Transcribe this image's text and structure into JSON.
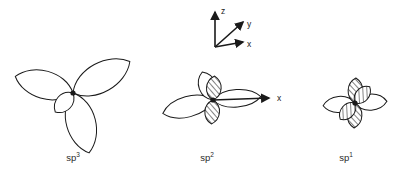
{
  "figure": {
    "background_color": "#ffffff",
    "stroke_color": "#1a1a1a",
    "width": 397,
    "height": 179,
    "title": ""
  },
  "axis_triad": {
    "name": "coordinate-axis-triad",
    "origin": {
      "x": 215,
      "y": 47
    },
    "axes": [
      {
        "id": "z",
        "label": "z",
        "tip": {
          "x": 215,
          "y": 12
        },
        "label_pos": {
          "x": 221,
          "y": 14
        }
      },
      {
        "id": "y",
        "label": "y",
        "tip": {
          "x": 243,
          "y": 22
        },
        "label_pos": {
          "x": 247,
          "y": 27
        }
      },
      {
        "id": "x",
        "label": "x",
        "tip": {
          "x": 243,
          "y": 42
        },
        "label_pos": {
          "x": 247,
          "y": 47
        }
      }
    ]
  },
  "groups": [
    {
      "id": "sp3",
      "name": "sp3-orbital-diagram",
      "caption_text": "sp",
      "caption_superscript": "3",
      "caption_pos": {
        "x": 73,
        "y": 152
      },
      "center": {
        "x": 73,
        "y": 93
      },
      "lobes": [
        {
          "id": "sp3-lobe-upper-left",
          "angle_deg": 196,
          "length": 60,
          "width": 19,
          "style": "outline"
        },
        {
          "id": "sp3-lobe-upper-right",
          "angle_deg": 331,
          "length": 65,
          "width": 20,
          "style": "outline"
        },
        {
          "id": "sp3-lobe-bottom",
          "angle_deg": 75,
          "length": 62,
          "width": 20,
          "style": "outline"
        },
        {
          "id": "sp3-lobe-back-small",
          "angle_deg": 133,
          "length": 26,
          "width": 11,
          "style": "outline"
        }
      ]
    },
    {
      "id": "sp2",
      "name": "sp2-orbital-diagram",
      "caption_text": "sp",
      "caption_superscript": "2",
      "caption_pos": {
        "x": 207,
        "y": 152
      },
      "center": {
        "x": 213,
        "y": 100
      },
      "lobes": [
        {
          "id": "sp2-lobe-left-long",
          "angle_deg": 165,
          "length": 52,
          "width": 14,
          "style": "outline"
        },
        {
          "id": "sp2-lobe-upper-left",
          "angle_deg": 249,
          "length": 30,
          "width": 12,
          "style": "outline"
        },
        {
          "id": "sp2-lobe-right",
          "angle_deg": 356,
          "length": 48,
          "width": 12,
          "style": "outline"
        },
        {
          "id": "sp2-p-orbital-up",
          "angle_deg": 274,
          "length": 24,
          "width": 10,
          "style": "hatched"
        },
        {
          "id": "sp2-p-orbital-down",
          "angle_deg": 94,
          "length": 24,
          "width": 10,
          "style": "hatched"
        }
      ],
      "axis_arrow": {
        "id": "sp2-x-axis",
        "label": "x",
        "from": {
          "x": 213,
          "y": 100
        },
        "to": {
          "x": 269,
          "y": 98
        },
        "label_pos": {
          "x": 277,
          "y": 101
        }
      }
    },
    {
      "id": "sp1",
      "name": "sp1-orbital-diagram",
      "caption_text": "sp",
      "caption_superscript": "1",
      "caption_pos": {
        "x": 346,
        "y": 152
      },
      "center": {
        "x": 355,
        "y": 103
      },
      "lobes": [
        {
          "id": "sp1-lobe-left",
          "angle_deg": 175,
          "length": 32,
          "width": 11,
          "style": "outline"
        },
        {
          "id": "sp1-lobe-right",
          "angle_deg": 357,
          "length": 32,
          "width": 11,
          "style": "outline"
        },
        {
          "id": "sp1-p-orbital-up",
          "angle_deg": 272,
          "length": 25,
          "width": 10,
          "style": "hatched"
        },
        {
          "id": "sp1-p-orbital-down",
          "angle_deg": 92,
          "length": 25,
          "width": 10,
          "style": "hatched"
        },
        {
          "id": "sp1-p-orbital-diag-up",
          "angle_deg": 312,
          "length": 22,
          "width": 9,
          "style": "hatched"
        },
        {
          "id": "sp1-p-orbital-diag-down",
          "angle_deg": 132,
          "length": 22,
          "width": 9,
          "style": "hatched"
        }
      ]
    }
  ]
}
